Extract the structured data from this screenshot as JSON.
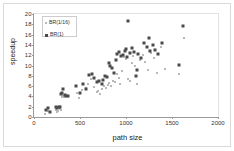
{
  "chart_data": {
    "type": "scatter",
    "title": "",
    "xlabel": "path size",
    "ylabel": "speedup",
    "xlim": [
      0,
      2000
    ],
    "ylim": [
      0,
      20
    ],
    "xticks": [
      0,
      500,
      1000,
      1500,
      2000
    ],
    "yticks": [
      0,
      2,
      4,
      6,
      8,
      10,
      12,
      14,
      16,
      18,
      20
    ],
    "grid": false,
    "legend_position": "top-left",
    "series": [
      {
        "name": "BR(1/16)",
        "marker": "small-square",
        "color": "#b9b9b9",
        "points": [
          [
            120,
            0.6
          ],
          [
            150,
            1.1
          ],
          [
            170,
            0.9
          ],
          [
            235,
            1.3
          ],
          [
            250,
            1.0
          ],
          [
            265,
            1.2
          ],
          [
            280,
            1.5
          ],
          [
            295,
            1.4
          ],
          [
            300,
            3.9
          ],
          [
            310,
            4.0
          ],
          [
            330,
            3.8
          ],
          [
            345,
            4.1
          ],
          [
            470,
            4.6
          ],
          [
            490,
            3.6
          ],
          [
            520,
            5.2
          ],
          [
            560,
            5.6
          ],
          [
            590,
            6.5
          ],
          [
            620,
            7.3
          ],
          [
            650,
            5.9
          ],
          [
            680,
            4.8
          ],
          [
            700,
            5.0
          ],
          [
            720,
            4.4
          ],
          [
            740,
            5.4
          ],
          [
            760,
            6.0
          ],
          [
            780,
            5.7
          ],
          [
            800,
            6.2
          ],
          [
            820,
            6.6
          ],
          [
            840,
            6.1
          ],
          [
            860,
            7.0
          ],
          [
            880,
            6.8
          ],
          [
            900,
            8.4
          ],
          [
            920,
            7.6
          ],
          [
            940,
            6.4
          ],
          [
            960,
            9.0
          ],
          [
            980,
            11.6
          ],
          [
            1000,
            11.2
          ],
          [
            1020,
            7.4
          ],
          [
            1040,
            6.9
          ],
          [
            1060,
            10.4
          ],
          [
            1080,
            11.8
          ],
          [
            1100,
            10.0
          ],
          [
            1120,
            6.5
          ],
          [
            1150,
            11.0
          ],
          [
            1180,
            12.0
          ],
          [
            1210,
            10.6
          ],
          [
            1240,
            9.2
          ],
          [
            1270,
            12.4
          ],
          [
            1300,
            11.4
          ],
          [
            1340,
            8.6
          ],
          [
            1380,
            13.6
          ],
          [
            1420,
            9.4
          ],
          [
            1575,
            8.3
          ],
          [
            1630,
            15.4
          ]
        ]
      },
      {
        "name": "BR(1)",
        "marker": "square",
        "color": "#4a4a4a",
        "points": [
          [
            125,
            1.4
          ],
          [
            155,
            1.7
          ],
          [
            175,
            1.0
          ],
          [
            240,
            2.0
          ],
          [
            255,
            1.8
          ],
          [
            270,
            1.9
          ],
          [
            285,
            2.0
          ],
          [
            290,
            4.4
          ],
          [
            305,
            4.6
          ],
          [
            315,
            5.4
          ],
          [
            335,
            4.2
          ],
          [
            350,
            4.0
          ],
          [
            365,
            4.1
          ],
          [
            460,
            6.0
          ],
          [
            500,
            4.6
          ],
          [
            530,
            6.4
          ],
          [
            565,
            5.5
          ],
          [
            600,
            8.2
          ],
          [
            625,
            8.4
          ],
          [
            655,
            7.6
          ],
          [
            690,
            6.8
          ],
          [
            710,
            7.0
          ],
          [
            735,
            6.4
          ],
          [
            755,
            7.2
          ],
          [
            775,
            8.0
          ],
          [
            795,
            7.8
          ],
          [
            815,
            10.4
          ],
          [
            830,
            10.0
          ],
          [
            850,
            9.6
          ],
          [
            870,
            8.6
          ],
          [
            890,
            11.0
          ],
          [
            905,
            12.2
          ],
          [
            925,
            12.6
          ],
          [
            945,
            11.8
          ],
          [
            965,
            12.0
          ],
          [
            985,
            12.8
          ],
          [
            1000,
            13.2
          ],
          [
            1010,
            11.6
          ],
          [
            1020,
            18.7
          ],
          [
            1045,
            12.4
          ],
          [
            1065,
            13.4
          ],
          [
            1090,
            12.6
          ],
          [
            1110,
            8.0
          ],
          [
            1135,
            12.2
          ],
          [
            1165,
            11.4
          ],
          [
            1195,
            14.4
          ],
          [
            1225,
            13.6
          ],
          [
            1245,
            15.4
          ],
          [
            1265,
            12.8
          ],
          [
            1290,
            14.0
          ],
          [
            1310,
            13.0
          ],
          [
            1345,
            12.2
          ],
          [
            1395,
            14.4
          ],
          [
            1120,
            9.2
          ],
          [
            1575,
            10.1
          ],
          [
            1620,
            17.7
          ]
        ]
      }
    ]
  }
}
